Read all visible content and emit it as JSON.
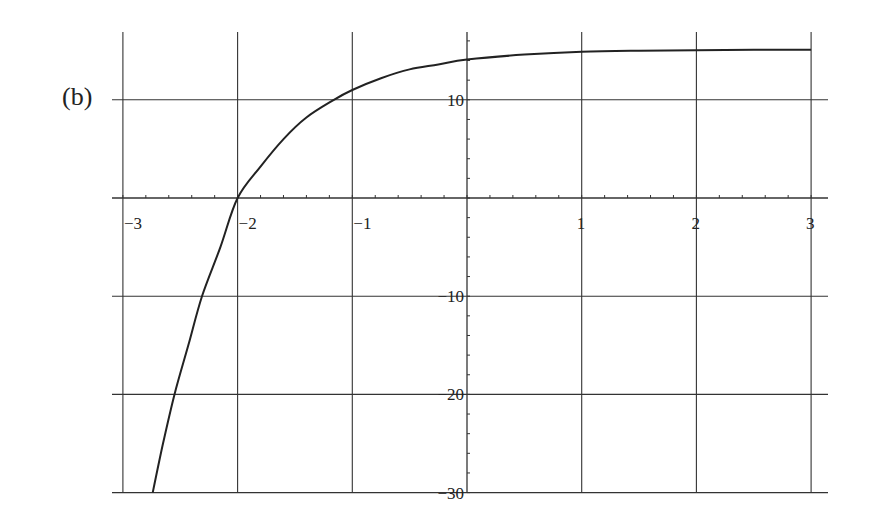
{
  "panel_label": "(b)",
  "chart_data": {
    "type": "line",
    "title": "",
    "xlabel": "",
    "ylabel": "",
    "xlim": [
      -3,
      3
    ],
    "ylim": [
      -30,
      17
    ],
    "grid": true,
    "x_ticks": [
      -3,
      -2,
      -1,
      1,
      2,
      3
    ],
    "x_tick_labels": [
      "−3",
      "−2",
      "−1",
      "1",
      "2",
      "3"
    ],
    "y_ticks": [
      10,
      -10,
      -20,
      -30
    ],
    "y_tick_labels": [
      "10",
      "−10",
      "−20",
      "−30"
    ],
    "grid_x": [
      -3,
      -2,
      -1,
      0,
      1,
      2,
      3
    ],
    "grid_y": [
      10,
      0,
      -10,
      -20,
      -30
    ],
    "series": [
      {
        "name": "curve",
        "x": [
          -2.74,
          -2.65,
          -2.55,
          -2.43,
          -2.31,
          -2.15,
          -2.0,
          -1.8,
          -1.6,
          -1.4,
          -1.16,
          -1.0,
          -0.75,
          -0.5,
          -0.25,
          0,
          0.5,
          1.0,
          1.5,
          2.0,
          2.5,
          3.0
        ],
        "y": [
          -30,
          -25,
          -20,
          -15,
          -10,
          -5,
          0,
          3.2,
          6.0,
          8.2,
          10.0,
          11.0,
          12.2,
          13.1,
          13.6,
          14.1,
          14.6,
          14.9,
          15.0,
          15.05,
          15.1,
          15.1
        ]
      }
    ]
  }
}
